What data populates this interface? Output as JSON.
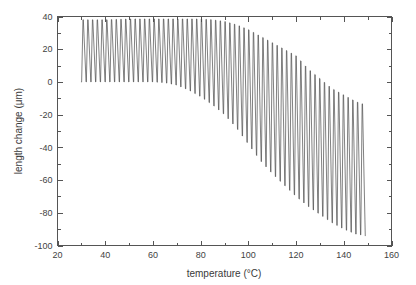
{
  "chart_data": {
    "type": "line",
    "title": "",
    "subtitle": "",
    "xlabel": "temperature (°C)",
    "ylabel": "length change (μm)",
    "xlim": [
      20,
      160
    ],
    "ylim": [
      -100,
      40
    ],
    "x_major_ticks": [
      20,
      40,
      60,
      80,
      100,
      120,
      140,
      160
    ],
    "x_tick_labels": [
      "20",
      "40",
      "60",
      "80",
      "100",
      "120",
      "140",
      "160"
    ],
    "x_minor_tick_interval": 10,
    "y_major_ticks": [
      -100,
      -80,
      -60,
      -40,
      -20,
      0,
      20,
      40
    ],
    "y_tick_labels": [
      "-100",
      "-80",
      "-60",
      "-40",
      "-20",
      "0",
      "20",
      "40"
    ],
    "y_minor_tick_interval": 10,
    "grid": false,
    "legend": false,
    "legend_position": "none",
    "line_color": "#4a4a4a",
    "background_color": "#ffffff",
    "frame_color": "#555555",
    "series": [
      {
        "name": "length change",
        "x_start": 30,
        "x_end": 149,
        "cycle_count": 60,
        "upper_envelope": {
          "x": [
            30,
            40,
            50,
            60,
            70,
            75,
            80,
            85,
            90,
            95,
            100,
            105,
            110,
            115,
            120,
            125,
            130,
            135,
            140,
            145,
            149
          ],
          "y": [
            38,
            38,
            38.5,
            38.5,
            38.5,
            38.5,
            38.5,
            38,
            37,
            35,
            32,
            28,
            24,
            20,
            16,
            8,
            2,
            -4,
            -8,
            -12,
            -14
          ]
        },
        "lower_envelope": {
          "x": [
            30,
            40,
            50,
            60,
            65,
            70,
            75,
            80,
            85,
            90,
            95,
            100,
            105,
            110,
            115,
            120,
            125,
            130,
            135,
            140,
            145,
            149
          ],
          "y": [
            0,
            0,
            0,
            0,
            -0.5,
            -2,
            -5,
            -9,
            -14,
            -20,
            -28,
            -38,
            -48,
            -56,
            -63,
            -70,
            -76,
            -81,
            -86,
            -90,
            -93,
            -94
          ]
        }
      }
    ]
  },
  "figure": {
    "caption": ""
  }
}
